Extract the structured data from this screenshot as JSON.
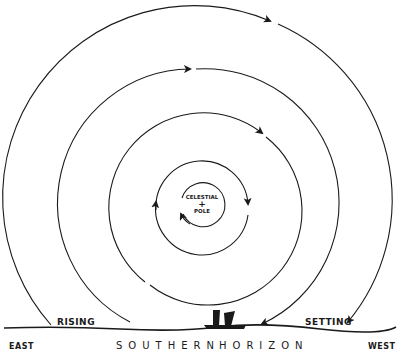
{
  "diagram": {
    "title": "",
    "center_label": {
      "line1": "CELESTIAL",
      "symbol": "+",
      "line2": "POLE"
    },
    "labels": {
      "east": "EAST",
      "west": "WEST",
      "rising": "RISING",
      "setting": "SETTING",
      "southern": "SOUTHERN",
      "horizon": "HORIZON"
    },
    "circles": [
      {
        "name": "innermost",
        "radius": 22,
        "direction": "counterclockwise-arrow"
      },
      {
        "name": "second",
        "radius": 46,
        "direction": "clockwise"
      },
      {
        "name": "third",
        "radius": 93,
        "direction": "clockwise"
      },
      {
        "name": "fourth",
        "radius": 134,
        "direction": "clockwise",
        "cut_by_horizon": true
      },
      {
        "name": "outer",
        "radius": 192,
        "direction": "clockwise",
        "cut_by_horizon": true
      }
    ],
    "colors": {
      "line": "#1a1a1a",
      "background": "#ffffff"
    }
  }
}
